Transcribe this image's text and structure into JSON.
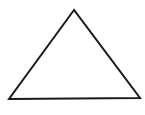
{
  "diagram": {
    "shape": "triangle",
    "style": "outline",
    "stroke_color": "#1a1a1a",
    "fill_color": "#ffffff",
    "stroke_width": 2,
    "vertices": {
      "apex": [
        74,
        10
      ],
      "base_left": [
        9,
        99
      ],
      "base_right": [
        140,
        98
      ]
    }
  }
}
